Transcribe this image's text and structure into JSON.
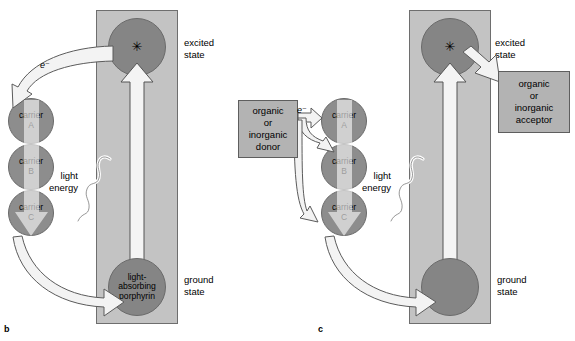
{
  "figure": {
    "panels": [
      {
        "id": "b",
        "label": "b",
        "type": "cyclic",
        "column_labels": {
          "excited": "excited\nstate",
          "ground": "ground\nstate"
        },
        "excited_state_symbol": "✳",
        "ground_state_text": "light-\nabsorbing\nporphyrin",
        "light_energy_label": "light\nenergy",
        "electron_label": "e⁻",
        "carriers": [
          {
            "name": "carrier\nA",
            "line1": "carrier",
            "line2": "A"
          },
          {
            "name": "carrier\nB",
            "line1": "carrier",
            "line2": "B"
          },
          {
            "name": "carrier\nC",
            "line1": "carrier",
            "line2": "C"
          }
        ]
      },
      {
        "id": "c",
        "label": "c",
        "type": "noncyclic",
        "column_labels": {
          "excited": "excited\nstate",
          "ground": "ground\nstate"
        },
        "excited_state_symbol": "✳",
        "ground_state_text": "",
        "light_energy_label": "light\nenergy",
        "electron_label": "e⁻",
        "donor_box": "organic\nor\ninorganic\ndonor",
        "acceptor_box": "organic\nor\ninorganic\nacceptor",
        "carriers": [
          {
            "name": "carrier\nA",
            "line1": "carrier",
            "line2": "A"
          },
          {
            "name": "carrier\nB",
            "line1": "carrier",
            "line2": "B"
          },
          {
            "name": "carrier\nC",
            "line1": "carrier",
            "line2": "C"
          }
        ]
      }
    ]
  },
  "colors": {
    "panel_background": "#c3c3c3",
    "panel_border": "#6e6e6e",
    "circle_fill": "#858585",
    "carrier_fill": "#8d8d8d",
    "box_fill": "#b3b3b3",
    "box_border": "#5e5e5e",
    "arrow_fill": "#f2f2f2",
    "arrow_stroke": "#5a5a5a",
    "page_background": "#ffffff",
    "text": "#000000"
  }
}
